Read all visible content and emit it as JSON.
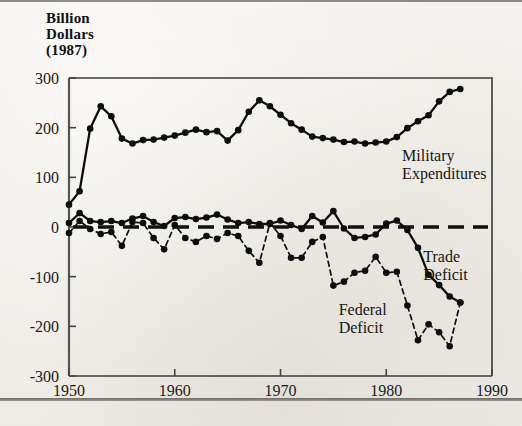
{
  "figure": {
    "axis_title": "Billion\nDollars\n(1987)",
    "background_color": "#f2f0ec",
    "ink_color": "#111111"
  },
  "chart_data": {
    "type": "line",
    "title": "",
    "subtitle": "",
    "xlabel": "",
    "ylabel": "Billion Dollars (1987)",
    "xlim": [
      1950,
      1990
    ],
    "ylim": [
      -300,
      300
    ],
    "xticks": [
      1950,
      1960,
      1970,
      1980,
      1990
    ],
    "xtick_labels": [
      "1950",
      "1960",
      "1970",
      "1980",
      "1990"
    ],
    "yticks": [
      300,
      200,
      100,
      0,
      -100,
      -200,
      -300
    ],
    "ytick_labels": [
      "300",
      "200",
      "100",
      "0",
      "-100",
      "-200",
      "-300"
    ],
    "grid": false,
    "legend": "inline-annotations",
    "zero_reference_line": {
      "value": 0,
      "style": "dashed"
    },
    "series": [
      {
        "name": "Military Expenditures",
        "label": "Military\nExpenditures",
        "style": "solid",
        "marker": "filled-circle",
        "label_x": 1981.5,
        "label_y": 132,
        "x": [
          1950,
          1951,
          1952,
          1953,
          1954,
          1955,
          1956,
          1957,
          1958,
          1959,
          1960,
          1961,
          1962,
          1963,
          1964,
          1965,
          1966,
          1967,
          1968,
          1969,
          1970,
          1971,
          1972,
          1973,
          1974,
          1975,
          1976,
          1977,
          1978,
          1979,
          1980,
          1981,
          1982,
          1983,
          1984,
          1985,
          1986,
          1987
        ],
        "values": [
          45,
          72,
          198,
          243,
          223,
          178,
          168,
          175,
          176,
          180,
          184,
          190,
          196,
          191,
          193,
          174,
          195,
          232,
          255,
          243,
          226,
          209,
          196,
          182,
          179,
          176,
          171,
          172,
          168,
          170,
          172,
          181,
          199,
          213,
          225,
          253,
          272,
          278
        ]
      },
      {
        "name": "Trade Deficit",
        "label": "Trade\nDeficit",
        "style": "solid",
        "marker": "filled-circle",
        "label_x": 1983.5,
        "label_y": -70,
        "x": [
          1950,
          1951,
          1952,
          1953,
          1954,
          1955,
          1956,
          1957,
          1958,
          1959,
          1960,
          1961,
          1962,
          1963,
          1964,
          1965,
          1966,
          1967,
          1968,
          1969,
          1970,
          1971,
          1972,
          1973,
          1974,
          1975,
          1976,
          1977,
          1978,
          1979,
          1980,
          1981,
          1982,
          1983,
          1984,
          1985,
          1986,
          1987
        ],
        "values": [
          8,
          28,
          12,
          10,
          12,
          8,
          17,
          22,
          10,
          2,
          18,
          20,
          16,
          19,
          25,
          15,
          8,
          10,
          6,
          6,
          13,
          4,
          -4,
          22,
          9,
          32,
          -3,
          -22,
          -20,
          -15,
          7,
          13,
          -6,
          -42,
          -96,
          -117,
          -140,
          -152
        ]
      },
      {
        "name": "Federal Deficit",
        "label": "Federal\nDeficit",
        "style": "dashed",
        "marker": "filled-circle",
        "label_x": 1975.5,
        "label_y": -178,
        "x": [
          1950,
          1951,
          1952,
          1953,
          1954,
          1955,
          1956,
          1957,
          1958,
          1959,
          1960,
          1961,
          1962,
          1963,
          1964,
          1965,
          1966,
          1967,
          1968,
          1969,
          1970,
          1971,
          1972,
          1973,
          1974,
          1975,
          1976,
          1977,
          1978,
          1979,
          1980,
          1981,
          1982,
          1983,
          1984,
          1985,
          1986,
          1987
        ],
        "values": [
          -12,
          12,
          -4,
          -14,
          -10,
          -38,
          10,
          8,
          -22,
          -45,
          4,
          -22,
          -30,
          -18,
          -24,
          -12,
          -18,
          -48,
          -72,
          8,
          -18,
          -62,
          -62,
          -30,
          -20,
          -118,
          -110,
          -92,
          -88,
          -60,
          -92,
          -90,
          -158,
          -228,
          -196,
          -212,
          -240,
          -152
        ]
      }
    ]
  }
}
